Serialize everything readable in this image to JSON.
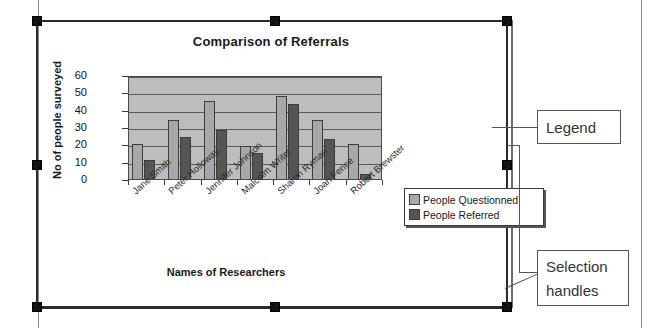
{
  "chart_data": {
    "type": "bar",
    "title": "Comparison of Referrals",
    "xlabel": "Names of Researchers",
    "ylabel": "No of people surveyed",
    "categories": [
      "Jane Smith",
      "Peter Holloway",
      "Jennifer Johnson",
      "Malcolm Writer",
      "Sharon Ryman",
      "Joan Fence",
      "Robert Brewster"
    ],
    "series": [
      {
        "name": "People Questionned",
        "color": "#a8a8a8",
        "values": [
          20,
          34,
          45,
          19,
          48,
          34,
          20
        ]
      },
      {
        "name": "People Referred",
        "color": "#555555",
        "values": [
          11,
          24,
          28,
          15,
          43,
          23,
          3
        ]
      }
    ],
    "ylim": [
      0,
      60
    ],
    "yticks": [
      60,
      50,
      40,
      30,
      20,
      10,
      0
    ],
    "grid": true,
    "legend_position": "right",
    "plot_background": "#bdbdbd"
  },
  "annotations": {
    "legend_callout": "Legend",
    "handles_callout": "Selection handles"
  },
  "selection": {
    "handle_count": 8,
    "handle_color": "#111111"
  }
}
